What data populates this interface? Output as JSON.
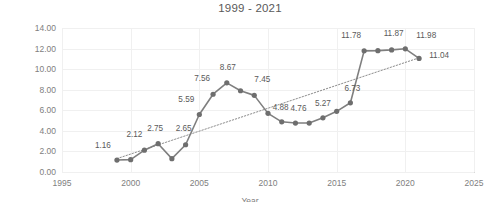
{
  "chart_data": {
    "type": "line",
    "title": "1999 - 2021",
    "xlabel": "Year",
    "ylabel": "Number of CVEs",
    "xlim": [
      1995,
      2025
    ],
    "ylim": [
      0,
      14
    ],
    "ytick_step": 2,
    "xtick_step": 5,
    "grid": true,
    "legend": "none",
    "marker": "circle",
    "line_color": "#808080",
    "trendline": {
      "type": "linear",
      "style": "dotted",
      "color": "#808080",
      "x_start": 1999,
      "y_start": 1.3,
      "x_end": 2021,
      "y_end": 11.1
    },
    "x": [
      1999,
      2000,
      2001,
      2002,
      2003,
      2004,
      2005,
      2006,
      2007,
      2008,
      2009,
      2010,
      2011,
      2012,
      2013,
      2014,
      2015,
      2016,
      2017,
      2018,
      2019,
      2020,
      2021
    ],
    "values": [
      1.16,
      1.2,
      2.12,
      2.75,
      1.3,
      2.65,
      5.59,
      7.56,
      8.67,
      7.9,
      7.45,
      5.7,
      4.88,
      4.76,
      4.76,
      5.27,
      5.9,
      6.73,
      11.78,
      11.8,
      11.87,
      11.98,
      11.04
    ],
    "point_labels": [
      {
        "x": 1999,
        "y": 1.16,
        "text": "1.16",
        "dx": -14,
        "dy": -13
      },
      {
        "x": 2001,
        "y": 2.12,
        "text": "2.12",
        "dx": -10,
        "dy": -14
      },
      {
        "x": 2002,
        "y": 2.75,
        "text": "2.75",
        "dx": -3,
        "dy": -14
      },
      {
        "x": 2004,
        "y": 2.65,
        "text": "2.65",
        "dx": -2,
        "dy": -15
      },
      {
        "x": 2005,
        "y": 5.59,
        "text": "5.59",
        "dx": -13,
        "dy": -14
      },
      {
        "x": 2006,
        "y": 7.56,
        "text": "7.56",
        "dx": -11,
        "dy": -14
      },
      {
        "x": 2007,
        "y": 8.67,
        "text": "8.67",
        "dx": 1,
        "dy": -14
      },
      {
        "x": 2009,
        "y": 7.45,
        "text": "7.45",
        "dx": 8,
        "dy": -14
      },
      {
        "x": 2011,
        "y": 4.88,
        "text": "4.88",
        "dx": -1,
        "dy": -13
      },
      {
        "x": 2012,
        "y": 4.76,
        "text": "4.76",
        "dx": 3,
        "dy": -13
      },
      {
        "x": 2014,
        "y": 5.27,
        "text": "5.27",
        "dx": 0,
        "dy": -13
      },
      {
        "x": 2016,
        "y": 6.73,
        "text": "6.73",
        "dx": 2,
        "dy": -13
      },
      {
        "x": 2017,
        "y": 11.78,
        "text": "11.78",
        "dx": -13,
        "dy": -14
      },
      {
        "x": 2019,
        "y": 11.87,
        "text": "11.87",
        "dx": 2,
        "dy": -15
      },
      {
        "x": 2020,
        "y": 11.98,
        "text": "11.98",
        "dx": 21,
        "dy": -12
      },
      {
        "x": 2021,
        "y": 11.04,
        "text": "11.04",
        "dx": 20,
        "dy": -1
      }
    ],
    "ytick_labels": [
      "0.00",
      "2.00",
      "4.00",
      "6.00",
      "8.00",
      "10.00",
      "12.00",
      "14.00"
    ],
    "xtick_labels": [
      "1995",
      "2000",
      "2005",
      "2010",
      "2015",
      "2020",
      "2025"
    ]
  }
}
